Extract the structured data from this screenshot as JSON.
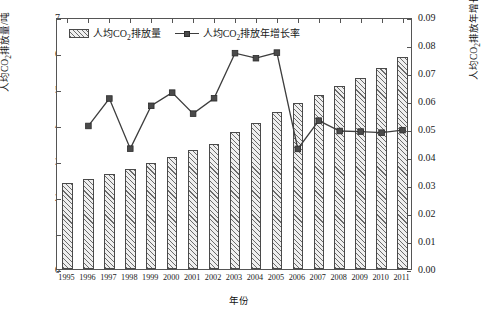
{
  "chart_data": {
    "type": "bar",
    "title": "",
    "xlabel": "年份",
    "ylabel": "人均CO₂排放量/吨",
    "ylabel_right": "人均CO₂排放年增长率",
    "categories": [
      "1995",
      "1996",
      "1997",
      "1998",
      "1999",
      "2000",
      "2001",
      "2002",
      "2003",
      "2004",
      "2005",
      "2006",
      "2007",
      "2008",
      "2009",
      "2010",
      "2011"
    ],
    "ylim": [
      0,
      7
    ],
    "ylim_right": [
      0,
      0.09
    ],
    "yticks": [
      "0",
      "1",
      "2",
      "3",
      "4",
      "5",
      "6",
      "7"
    ],
    "yticks_right": [
      "0.00",
      "0.01",
      "0.02",
      "0.03",
      "0.04",
      "0.05",
      "0.06",
      "0.07",
      "0.08",
      "0.09"
    ],
    "grid": false,
    "legend_position": "top-left",
    "series": [
      {
        "name": "人均CO₂排放量",
        "type": "bar",
        "axis": "left",
        "unit": "吨",
        "values": [
          2.38,
          2.5,
          2.65,
          2.77,
          2.94,
          3.12,
          3.3,
          3.47,
          3.8,
          4.06,
          4.37,
          4.6,
          4.83,
          5.09,
          5.3,
          5.57,
          5.88
        ]
      },
      {
        "name": "人均CO₂排放年增长率",
        "type": "line",
        "axis": "right",
        "values": [
          null,
          0.0518,
          0.0616,
          0.0437,
          0.059,
          0.0637,
          0.0562,
          0.0617,
          0.0778,
          0.076,
          0.078,
          0.0436,
          0.0537,
          0.05,
          0.0498,
          0.0494,
          0.0503
        ]
      }
    ]
  },
  "legend": {
    "bar_label_pre": "人均CO",
    "bar_label_sub": "2",
    "bar_label_post": "排放量",
    "line_label_pre": "人均CO",
    "line_label_sub": "2",
    "line_label_post": "排放年增长率"
  },
  "axis_titles": {
    "left_pre": "人均CO",
    "left_sub": "2",
    "left_post": "排放量/吨",
    "right_pre": "人均CO",
    "right_sub": "2",
    "right_post": "排放年增长率",
    "bottom": "年份"
  }
}
